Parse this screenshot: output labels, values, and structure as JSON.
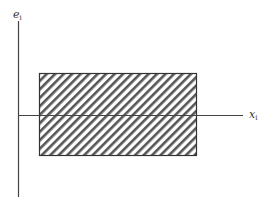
{
  "diagram": {
    "y_axis_label": "e",
    "y_axis_subscript": "i",
    "x_axis_label": "x",
    "x_axis_subscript": "i",
    "region": {
      "description": "hatched rectangular region spanning both sides of the x-axis",
      "fill": "diagonal hatch",
      "stroke_color": "#444444"
    }
  }
}
